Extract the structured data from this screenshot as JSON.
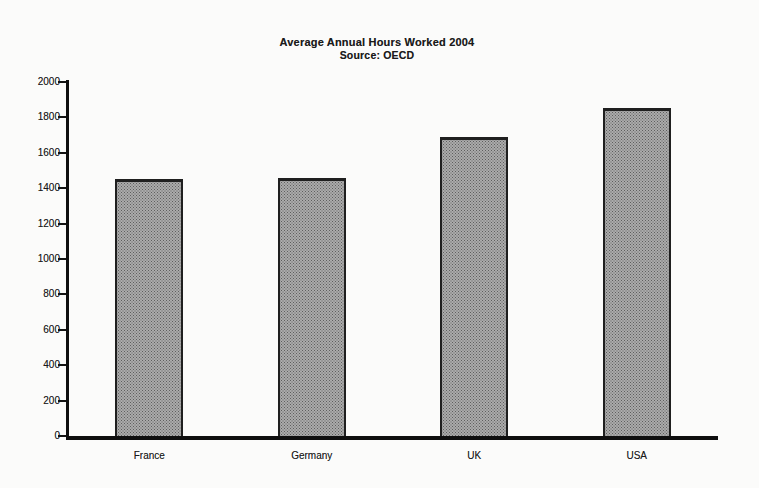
{
  "chart_data": {
    "type": "bar",
    "title": "Average Annual Hours Worked 2004",
    "subtitle": "Source: OECD",
    "categories": [
      "France",
      "Germany",
      "UK",
      "USA"
    ],
    "values": [
      1450,
      1460,
      1690,
      1855
    ],
    "xlabel": "",
    "ylabel": "",
    "ylim": [
      0,
      2000
    ],
    "yticks": [
      0,
      200,
      400,
      600,
      800,
      1000,
      1200,
      1400,
      1600,
      1800,
      2000
    ],
    "grid": false,
    "legend": "none",
    "bar_fill_color": "#ababab",
    "bar_dot_color": "#5e5e5e",
    "bar_border_color": "#1f1f1f",
    "axis_color": "#0f0f0f",
    "text_color": "#1b1b1b"
  }
}
